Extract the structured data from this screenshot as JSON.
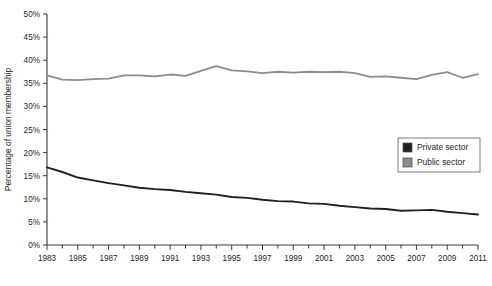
{
  "chart_data": {
    "type": "line",
    "title": "",
    "xlabel": "",
    "ylabel": "Percentage of union membership",
    "xlim": [
      1983,
      2011
    ],
    "ylim": [
      0,
      50
    ],
    "grid": false,
    "legend_position": "upper-right-inside",
    "y_ticks": [
      "0%",
      "5%",
      "10%",
      "15%",
      "20%",
      "25%",
      "30%",
      "35%",
      "40%",
      "45%",
      "50%"
    ],
    "y_tick_values": [
      0,
      5,
      10,
      15,
      20,
      25,
      30,
      35,
      40,
      45,
      50
    ],
    "x_ticks": [
      "1983",
      "1985",
      "1987",
      "1989",
      "1991",
      "1993",
      "1995",
      "1997",
      "1999",
      "2001",
      "2003",
      "2005",
      "2007",
      "2009",
      "2011"
    ],
    "x_tick_values": [
      1983,
      1985,
      1987,
      1989,
      1991,
      1993,
      1995,
      1997,
      1999,
      2001,
      2003,
      2005,
      2007,
      2009,
      2011
    ],
    "x_minor_tick_values": [
      1984,
      1986,
      1988,
      1990,
      1992,
      1994,
      1996,
      1998,
      2000,
      2002,
      2004,
      2006,
      2008,
      2010
    ],
    "x": [
      1983,
      1984,
      1985,
      1986,
      1987,
      1988,
      1989,
      1990,
      1991,
      1992,
      1993,
      1994,
      1995,
      1996,
      1997,
      1998,
      1999,
      2000,
      2001,
      2002,
      2003,
      2004,
      2005,
      2006,
      2007,
      2008,
      2009,
      2010,
      2011
    ],
    "series": [
      {
        "name": "Private sector",
        "color": "#231f20",
        "values": [
          16.8,
          15.8,
          14.6,
          14.0,
          13.4,
          12.9,
          12.4,
          12.1,
          11.9,
          11.5,
          11.2,
          10.9,
          10.4,
          10.2,
          9.8,
          9.5,
          9.4,
          9.0,
          8.9,
          8.5,
          8.2,
          7.9,
          7.8,
          7.4,
          7.5,
          7.6,
          7.2,
          6.9,
          6.6
        ]
      },
      {
        "name": "Public sector",
        "color": "#8c8c8c",
        "values": [
          36.7,
          35.8,
          35.7,
          35.9,
          36.0,
          36.7,
          36.7,
          36.5,
          36.9,
          36.6,
          37.7,
          38.7,
          37.8,
          37.6,
          37.2,
          37.5,
          37.3,
          37.5,
          37.4,
          37.5,
          37.2,
          36.4,
          36.5,
          36.2,
          35.9,
          36.8,
          37.4,
          36.2,
          37.0
        ]
      }
    ],
    "legend": [
      {
        "label": "Private sector",
        "swatch": "#231f20"
      },
      {
        "label": "Public sector",
        "swatch": "#8c8c8c"
      }
    ]
  }
}
